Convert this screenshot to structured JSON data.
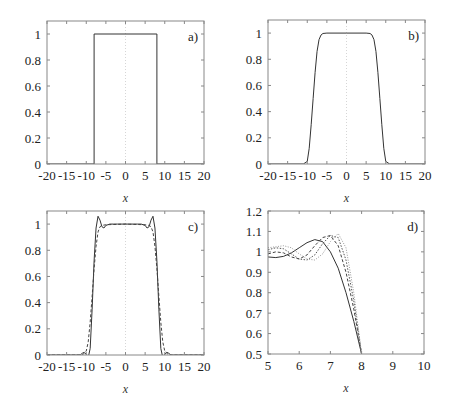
{
  "figure": {
    "panels": [
      "a)",
      "b)",
      "c)",
      "d)"
    ]
  },
  "chart_data": [
    {
      "type": "line",
      "panel": "a)",
      "title": "",
      "xlabel": "x",
      "ylabel": "",
      "xlim": [
        -20,
        20
      ],
      "ylim": [
        0,
        1.1
      ],
      "xticks": [
        "-20",
        "-15",
        "-10",
        "-5",
        "0",
        "5",
        "10",
        "15",
        "20"
      ],
      "yticks": [
        "0",
        "0.2",
        "0.4",
        "0.6",
        "0.8",
        "1"
      ],
      "grid": false,
      "series": [
        {
          "name": "rectangular pulse",
          "style": "solid",
          "x": [
            -20,
            -8,
            -8,
            8,
            8,
            20
          ],
          "y": [
            0,
            0,
            1,
            1,
            0,
            0
          ]
        }
      ],
      "annotations": [
        "vertical dotted line at x=0"
      ]
    },
    {
      "type": "line",
      "panel": "b)",
      "title": "",
      "xlabel": "x",
      "ylabel": "",
      "xlim": [
        -20,
        20
      ],
      "ylim": [
        0,
        1.1
      ],
      "xticks": [
        "-20",
        "-15",
        "-10",
        "-5",
        "0",
        "5",
        "10",
        "15",
        "20"
      ],
      "yticks": [
        "0",
        "0.2",
        "0.4",
        "0.6",
        "0.8",
        "1"
      ],
      "grid": false,
      "series": [
        {
          "name": "smoothed pulse",
          "style": "solid",
          "x": [
            -20,
            -11,
            -10,
            -9.5,
            -9,
            -8.5,
            -8,
            -7.5,
            -7,
            -6.5,
            -6,
            -5,
            0,
            5,
            6,
            6.5,
            7,
            7.5,
            8,
            8.5,
            9,
            9.5,
            10,
            11,
            20
          ],
          "y": [
            0,
            0,
            0.02,
            0.12,
            0.3,
            0.5,
            0.7,
            0.86,
            0.95,
            0.985,
            0.997,
            1,
            1,
            1,
            0.997,
            0.985,
            0.95,
            0.86,
            0.7,
            0.5,
            0.3,
            0.12,
            0.02,
            0,
            0
          ]
        }
      ]
    },
    {
      "type": "line",
      "panel": "c)",
      "title": "",
      "xlabel": "x",
      "ylabel": "",
      "xlim": [
        -20,
        20
      ],
      "ylim": [
        0,
        1.1
      ],
      "xticks": [
        "-20",
        "-15",
        "-10",
        "-5",
        "0",
        "5",
        "10",
        "15",
        "20"
      ],
      "yticks": [
        "0",
        "0.2",
        "0.4",
        "0.6",
        "0.8",
        "1"
      ],
      "grid": false,
      "series": [
        {
          "name": "solid (with overshoot)",
          "style": "solid",
          "x": [
            -20,
            -11.5,
            -11,
            -10.5,
            -10,
            -9.5,
            -9,
            -8.5,
            -8,
            -7.5,
            -7,
            -6.5,
            -6,
            -5.5,
            -5,
            -4,
            -3,
            -2,
            -1,
            0,
            1,
            2,
            3,
            4,
            5,
            5.5,
            6,
            6.5,
            7,
            7.5,
            8,
            8.5,
            9,
            9.5,
            10,
            10.5,
            11,
            11.5,
            20
          ],
          "y": [
            0,
            0,
            0.015,
            0.02,
            0.005,
            -0.02,
            0.05,
            0.35,
            0.72,
            0.97,
            1.06,
            1.03,
            0.98,
            0.97,
            0.99,
            1.0,
            1.0,
            1.0,
            1.0,
            1.0,
            1.0,
            1.0,
            1.0,
            1.0,
            0.99,
            0.97,
            0.98,
            1.03,
            1.06,
            0.97,
            0.72,
            0.35,
            0.05,
            -0.02,
            0.005,
            0.02,
            0.015,
            0,
            0
          ]
        },
        {
          "name": "dashed (smooth)",
          "style": "dashed",
          "x": [
            -20,
            -11,
            -10,
            -9.5,
            -9,
            -8.5,
            -8,
            -7.5,
            -7,
            -6.5,
            -6,
            -5,
            0,
            5,
            6,
            6.5,
            7,
            7.5,
            8,
            8.5,
            9,
            9.5,
            10,
            11,
            20
          ],
          "y": [
            0,
            0,
            0.03,
            0.1,
            0.25,
            0.45,
            0.66,
            0.83,
            0.94,
            0.98,
            0.99,
            0.995,
            1.0,
            0.995,
            0.99,
            0.98,
            0.94,
            0.83,
            0.66,
            0.45,
            0.25,
            0.1,
            0.03,
            0,
            0
          ]
        }
      ],
      "annotations": [
        "vertical dotted line at x=0"
      ]
    },
    {
      "type": "line",
      "panel": "d)",
      "title": "",
      "xlabel": "x",
      "ylabel": "",
      "xlim": [
        5,
        10
      ],
      "ylim": [
        0.5,
        1.2
      ],
      "xticks": [
        "5",
        "6",
        "7",
        "8",
        "9",
        "10"
      ],
      "yticks": [
        "0.5",
        "0.6",
        "0.7",
        "0.8",
        "0.9",
        "1",
        "1.1",
        "1.2"
      ],
      "grid": false,
      "series": [
        {
          "name": "solid",
          "style": "solid",
          "x": [
            5.0,
            5.25,
            5.5,
            5.75,
            6.0,
            6.25,
            6.5,
            6.75,
            7.0,
            7.25,
            7.5,
            7.75,
            8.0
          ],
          "y": [
            0.975,
            0.972,
            0.978,
            0.995,
            1.02,
            1.045,
            1.06,
            1.05,
            1.0,
            0.92,
            0.8,
            0.66,
            0.5
          ]
        },
        {
          "name": "dashed",
          "style": "dashed",
          "x": [
            5.0,
            5.25,
            5.5,
            5.75,
            6.0,
            6.25,
            6.5,
            6.75,
            7.0,
            7.25,
            7.5,
            7.75,
            8.0
          ],
          "y": [
            0.99,
            1.0,
            0.995,
            0.975,
            0.965,
            0.985,
            1.03,
            1.07,
            1.08,
            1.03,
            0.9,
            0.72,
            0.5
          ]
        },
        {
          "name": "dotted",
          "style": "dotted",
          "x": [
            5.0,
            5.25,
            5.5,
            5.75,
            6.0,
            6.25,
            6.5,
            6.75,
            7.0,
            7.25,
            7.5,
            7.75,
            8.0
          ],
          "y": [
            1.01,
            1.02,
            1.015,
            0.99,
            0.965,
            0.96,
            0.985,
            1.04,
            1.08,
            1.07,
            0.96,
            0.76,
            0.5
          ]
        },
        {
          "name": "light dotted",
          "style": "light-dotted",
          "x": [
            5.0,
            5.25,
            5.5,
            5.75,
            6.0,
            6.25,
            6.5,
            6.75,
            7.0,
            7.25,
            7.5,
            7.75,
            8.0
          ],
          "y": [
            1.02,
            1.025,
            1.03,
            1.02,
            0.99,
            0.965,
            0.96,
            0.99,
            1.05,
            1.09,
            1.02,
            0.8,
            0.5
          ]
        }
      ]
    }
  ]
}
